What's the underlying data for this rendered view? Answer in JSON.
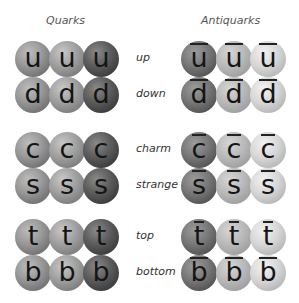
{
  "headings": {
    "quarks": "Quarks",
    "antiquarks": "Antiquarks"
  },
  "rows": [
    {
      "flavor": "up",
      "symbol": "u"
    },
    {
      "flavor": "down",
      "symbol": "d"
    },
    {
      "flavor": "charm",
      "symbol": "c"
    },
    {
      "flavor": "strange",
      "symbol": "s"
    },
    {
      "flavor": "top",
      "symbol": "t"
    },
    {
      "flavor": "bottom",
      "symbol": "b"
    }
  ],
  "colors_per_particle": 3
}
